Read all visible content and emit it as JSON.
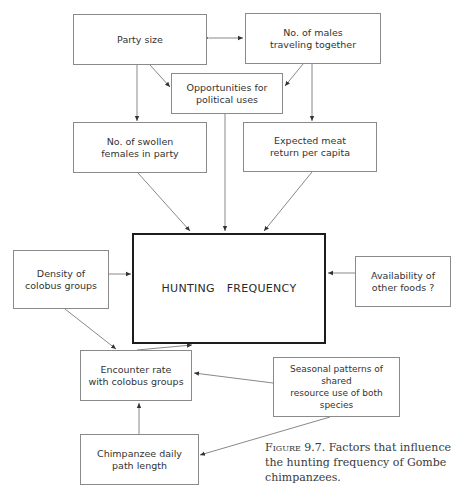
{
  "nodes": {
    "party_size": {
      "label": "Party size",
      "x": 73,
      "y": 14,
      "w": 134,
      "h": 51
    },
    "males_traveling": {
      "label": "No. of males\ntraveling  together",
      "x": 245,
      "y": 13,
      "w": 136,
      "h": 51
    },
    "political_uses": {
      "label": "Opportunities for\npolitical uses",
      "x": 171,
      "y": 73,
      "w": 112,
      "h": 41
    },
    "swollen_females": {
      "label": "No. of swollen\nfemales in party",
      "x": 73,
      "y": 122,
      "w": 134,
      "h": 51
    },
    "meat_return": {
      "label": "Expected meat\nreturn per capita",
      "x": 243,
      "y": 122,
      "w": 134,
      "h": 50
    },
    "hunting_frequency": {
      "label": "HUNTING  FREQUENCY",
      "x": 132,
      "y": 233,
      "w": 194,
      "h": 111
    },
    "colobus_density": {
      "label": "Density of\ncolobus  groups",
      "x": 13,
      "y": 250,
      "w": 96,
      "h": 59
    },
    "other_foods": {
      "label": "Availability of\nother foods ?",
      "x": 355,
      "y": 256,
      "w": 96,
      "h": 51
    },
    "encounter_rate": {
      "label": "Encounter rate\nwith  colobus groups",
      "x": 80,
      "y": 350,
      "w": 112,
      "h": 51
    },
    "seasonal_patterns": {
      "label": "Seasonal patterns of shared\nresource use of both species",
      "x": 273,
      "y": 357,
      "w": 127,
      "h": 60
    },
    "daily_path": {
      "label": "Chimpanzee daily\npath length",
      "x": 80,
      "y": 434,
      "w": 119,
      "h": 51
    }
  },
  "edges": [
    {
      "from": "party_size",
      "to": "males_traveling",
      "bidirectional": true
    },
    {
      "from": "party_size",
      "to": "political_uses"
    },
    {
      "from": "males_traveling",
      "to": "political_uses"
    },
    {
      "from": "party_size",
      "to": "swollen_females"
    },
    {
      "from": "males_traveling",
      "to": "meat_return"
    },
    {
      "from": "swollen_females",
      "to": "hunting_frequency"
    },
    {
      "from": "political_uses",
      "to": "hunting_frequency"
    },
    {
      "from": "meat_return",
      "to": "hunting_frequency"
    },
    {
      "from": "colobus_density",
      "to": "hunting_frequency"
    },
    {
      "from": "other_foods",
      "to": "hunting_frequency"
    },
    {
      "from": "colobus_density",
      "to": "encounter_rate"
    },
    {
      "from": "encounter_rate",
      "to": "hunting_frequency"
    },
    {
      "from": "seasonal_patterns",
      "to": "encounter_rate"
    },
    {
      "from": "seasonal_patterns",
      "to": "daily_path"
    },
    {
      "from": "daily_path",
      "to": "encounter_rate"
    }
  ],
  "caption": {
    "figure_label": "Figure 9.7.",
    "text": " Factors that influence the hunting frequency of Gombe chimpanzees."
  }
}
